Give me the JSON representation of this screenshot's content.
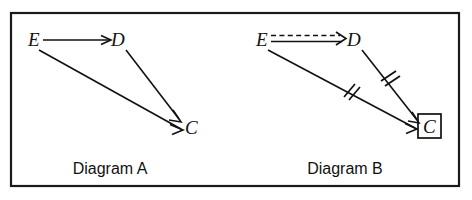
{
  "figure": {
    "background_color": "#ffffff",
    "ink_color": "#111111",
    "frame": {
      "x": 11,
      "y": 13,
      "width": 448,
      "height": 173
    }
  },
  "diagrams": [
    {
      "id": "diagram-a",
      "caption": "Diagram A",
      "caption_pos": {
        "x": 110,
        "y": 174
      },
      "nodes": [
        {
          "id": "E",
          "label": "E",
          "x": 32,
          "y": 46,
          "boxed": false
        },
        {
          "id": "D",
          "label": "D",
          "x": 120,
          "y": 46,
          "boxed": false
        },
        {
          "id": "C",
          "label": "C",
          "x": 191,
          "y": 134,
          "boxed": false
        }
      ],
      "edges": [
        {
          "id": "a-e-d",
          "from": "E",
          "to": "D",
          "style": "solid",
          "double_line": false,
          "arrowhead": true,
          "ticks": 0
        },
        {
          "id": "a-d-c",
          "from": "D",
          "to": "C",
          "style": "solid",
          "double_line": false,
          "arrowhead": true,
          "ticks": 0
        },
        {
          "id": "a-e-c",
          "from": "E",
          "to": "C",
          "style": "solid",
          "double_line": false,
          "arrowhead": true,
          "ticks": 0
        }
      ]
    },
    {
      "id": "diagram-b",
      "caption": "Diagram B",
      "caption_pos": {
        "x": 345,
        "y": 174
      },
      "nodes": [
        {
          "id": "E",
          "label": "E",
          "x": 261,
          "y": 46,
          "boxed": false
        },
        {
          "id": "D",
          "label": "D",
          "x": 355,
          "y": 46,
          "boxed": false
        },
        {
          "id": "C",
          "label": "C",
          "x": 429,
          "y": 133,
          "boxed": true
        }
      ],
      "edges": [
        {
          "id": "b-e-d",
          "from": "E",
          "to": "D",
          "style": "dashed-over-solid",
          "double_line": true,
          "arrowhead": true,
          "ticks": 0
        },
        {
          "id": "b-d-c",
          "from": "D",
          "to": "C",
          "style": "solid",
          "double_line": false,
          "arrowhead": true,
          "ticks": 2
        },
        {
          "id": "b-e-c",
          "from": "E",
          "to": "C",
          "style": "solid",
          "double_line": false,
          "arrowhead": true,
          "ticks": 2
        }
      ]
    }
  ]
}
